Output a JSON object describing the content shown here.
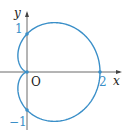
{
  "chart_data": {
    "type": "line",
    "title": "",
    "curve": "cardioid r = 1 + cos(theta)",
    "xlabel": "x",
    "ylabel": "y",
    "origin_label": "O",
    "x_ticks": [
      {
        "value": 2,
        "label": "2"
      }
    ],
    "y_ticks": [
      {
        "value": 1,
        "label": "1"
      },
      {
        "value": -1,
        "label": "-1"
      }
    ],
    "marked_points": [
      [
        0,
        1
      ],
      [
        0,
        0
      ],
      [
        2,
        0
      ],
      [
        0,
        -1
      ]
    ],
    "xlim": [
      -0.7,
      2.6
    ],
    "ylim": [
      -1.5,
      1.8
    ],
    "grid": false,
    "colors": {
      "curve": "#3a8fc8",
      "axes": "#333333",
      "tick_labels": "#3a8fc8"
    }
  },
  "labels": {
    "x_axis": "x",
    "y_axis": "y",
    "origin": "O",
    "tick_2": "2",
    "tick_1": "1",
    "tick_neg1": "−1"
  }
}
